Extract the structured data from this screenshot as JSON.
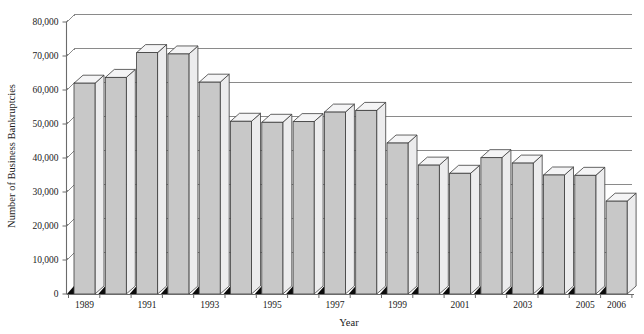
{
  "chart_data": {
    "type": "bar",
    "title": "",
    "subtitle": "",
    "xlabel": "Year",
    "ylabel": "Number of Business Bankruptcies",
    "categories": [
      "1989",
      "1990",
      "1991",
      "1992",
      "1993",
      "1994",
      "1995",
      "1996",
      "1997",
      "1998",
      "1999",
      "2000",
      "2001",
      "2002",
      "2003",
      "2004",
      "2005",
      "2006"
    ],
    "values": [
      62000,
      63700,
      71000,
      70600,
      62300,
      50800,
      50500,
      50700,
      53500,
      54000,
      44400,
      37900,
      35500,
      40100,
      38500,
      35000,
      34900,
      27300
    ],
    "visible_x_tick_labels": [
      "1989",
      "1991",
      "1993",
      "1995",
      "1997",
      "1999",
      "2001",
      "2003",
      "2005",
      "2006"
    ],
    "ytick_labels": [
      "80,000",
      "70,000",
      "60,000",
      "50,000",
      "40,000",
      "30,000",
      "20,000",
      "10,000",
      "0"
    ],
    "ytick_values": [
      80000,
      70000,
      60000,
      50000,
      40000,
      30000,
      20000,
      10000,
      0
    ],
    "ylim": [
      0,
      80000
    ],
    "ytick_step": 10000,
    "grid": true,
    "grid_axis": "y",
    "legend": false,
    "legend_position": "none",
    "style": "3d-column",
    "colors": {
      "bar_front": "#c8c8c8",
      "bar_side": "#ececed",
      "bar_top": "#f4f4f5",
      "bar_outline": "#3d3d3d",
      "bar_base_shadow": "#0b0b0b",
      "gridline": "#8a8a8a",
      "axis": "#6b6b6b",
      "text": "#1a1a1a",
      "background": "#ffffff"
    }
  }
}
